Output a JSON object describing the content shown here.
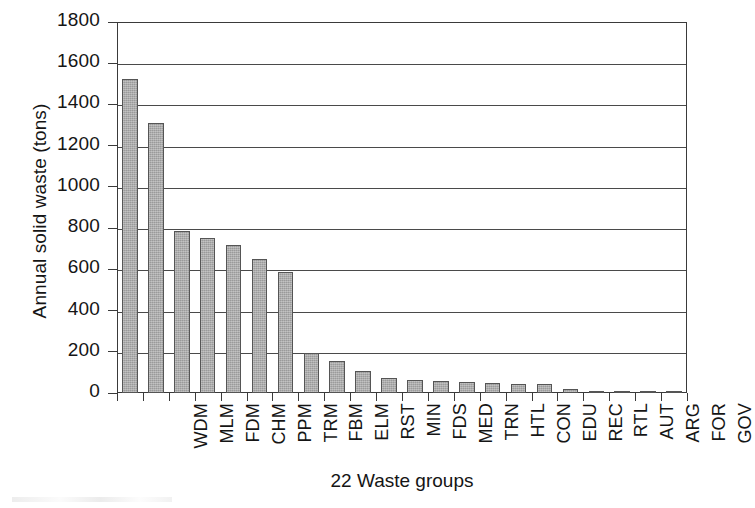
{
  "chart_data": {
    "type": "bar",
    "title": "",
    "xlabel": "22 Waste groups",
    "ylabel": "Annual solid waste (tons)",
    "categories": [
      "WDM",
      "MLM",
      "FDM",
      "CHM",
      "PPM",
      "TRM",
      "FBM",
      "ELM",
      "RST",
      "MIN",
      "FDS",
      "MED",
      "TRN",
      "HTL",
      "CON",
      "EDU",
      "REC",
      "RTL",
      "AUT",
      "ARG",
      "FOR",
      "GOV"
    ],
    "values": [
      1525,
      1310,
      785,
      750,
      720,
      650,
      585,
      193,
      157,
      105,
      75,
      62,
      57,
      52,
      50,
      46,
      42,
      18,
      12,
      10,
      5,
      1
    ],
    "ylim": [
      0,
      1800
    ],
    "ytick_labels": [
      "0",
      "200",
      "400",
      "600",
      "800",
      "1000",
      "1200",
      "1400",
      "1600",
      "1800"
    ],
    "ytick_values": [
      0,
      200,
      400,
      600,
      800,
      1000,
      1200,
      1400,
      1600,
      1800
    ],
    "grid": true,
    "legend": "none",
    "bar_color": "#a9a9a9",
    "bar_edge_color": "#555555",
    "axis_color": "#3a3a3a"
  }
}
